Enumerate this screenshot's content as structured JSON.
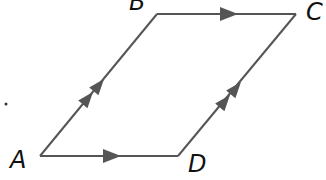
{
  "diagram": {
    "type": "parallelogram",
    "stroke_color": "#555555",
    "arrow_color": "#555555",
    "label_color": "#111111",
    "vertices": {
      "A": {
        "label": "A",
        "x": 40,
        "y": 156
      },
      "B": {
        "label": "B",
        "x": 157,
        "y": 14
      },
      "C": {
        "label": "C",
        "x": 296,
        "y": 14
      },
      "D": {
        "label": "D",
        "x": 178,
        "y": 156
      }
    },
    "edges": [
      {
        "from": "A",
        "to": "B",
        "arrows": 2
      },
      {
        "from": "B",
        "to": "C",
        "arrows": 1
      },
      {
        "from": "D",
        "to": "C",
        "arrows": 2
      },
      {
        "from": "A",
        "to": "D",
        "arrows": 1
      }
    ],
    "labels": {
      "A": "A",
      "B": "B",
      "C": "C",
      "D": "D"
    }
  }
}
